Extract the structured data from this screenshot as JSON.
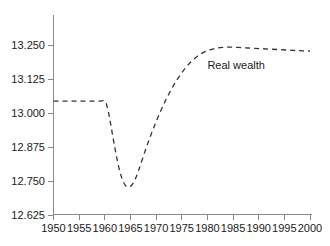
{
  "chart_data": {
    "type": "line",
    "title": "",
    "xlabel": "",
    "ylabel": "",
    "xlim": [
      1950,
      2000
    ],
    "ylim": [
      12.625,
      13.25
    ],
    "grid": false,
    "legend_position": "inline-annotation",
    "x_ticks": [
      "1950",
      "1955",
      "1960",
      "1965",
      "1970",
      "1975",
      "1980",
      "1985",
      "1990",
      "1995",
      "2000"
    ],
    "x_tick_values": [
      1950,
      1955,
      1960,
      1965,
      1970,
      1975,
      1980,
      1985,
      1990,
      1995,
      2000
    ],
    "y_ticks": [
      "12.625",
      "12.750",
      "12.875",
      "13.000",
      "13.125",
      "13.250"
    ],
    "y_tick_values": [
      12.625,
      12.75,
      12.875,
      13.0,
      13.125,
      13.25
    ],
    "annotations": [
      {
        "text": "Real wealth",
        "x": 1980,
        "y": 13.16
      }
    ],
    "series": [
      {
        "name": "Real wealth",
        "style": "dashed",
        "color": "#333333",
        "x": [
          1950,
          1952,
          1954,
          1956,
          1958,
          1959,
          1960,
          1960.5,
          1961,
          1961.5,
          1962,
          1962.5,
          1963,
          1963.5,
          1964,
          1964.5,
          1965,
          1965.5,
          1966,
          1966.5,
          1967,
          1968,
          1969,
          1970,
          1971,
          1972,
          1973,
          1974,
          1975,
          1976,
          1977,
          1978,
          1979,
          1980,
          1981,
          1982,
          1983,
          1984,
          1985,
          1986,
          1987,
          1988,
          1990,
          1992,
          1994,
          1996,
          1998,
          2000
        ],
        "y": [
          13.044,
          13.044,
          13.044,
          13.044,
          13.044,
          13.044,
          13.044,
          13.02,
          12.975,
          12.92,
          12.868,
          12.82,
          12.78,
          12.752,
          12.734,
          12.728,
          12.73,
          12.741,
          12.76,
          12.784,
          12.812,
          12.868,
          12.92,
          12.968,
          13.012,
          13.052,
          13.088,
          13.12,
          13.148,
          13.172,
          13.192,
          13.208,
          13.22,
          13.229,
          13.235,
          13.239,
          13.241,
          13.242,
          13.242,
          13.241,
          13.24,
          13.239,
          13.237,
          13.235,
          13.233,
          13.231,
          13.229,
          13.228
        ]
      }
    ]
  }
}
